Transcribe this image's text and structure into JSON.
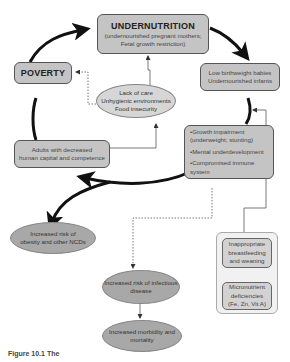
{
  "nodes": {
    "undernutrition": {
      "title": "UNDERNUTRITION",
      "lines": [
        "(undernourished pregnant mothers;",
        "Fetal growth restriction)"
      ]
    },
    "poverty": {
      "title": "POVERTY"
    },
    "low_birthweight": {
      "lines": [
        "Low birthweight babies",
        "Undernourished infants"
      ]
    },
    "causes": {
      "lines": [
        "Lack of care",
        "Unhygienic environments",
        "Food insecurity"
      ]
    },
    "growth_impairment": {
      "bullets": [
        "•Growth impairment",
        "(underweight; stunting)",
        "•Mental underdevelopment",
        "•Compromised immune system"
      ]
    },
    "adults": {
      "lines": [
        "Adults with decreased",
        "human capital and competence"
      ]
    },
    "obesity_risk": {
      "lines": [
        "Increased risk of",
        "obesity and other NCDs"
      ]
    },
    "infectious_risk": {
      "lines": [
        "Increased risk of infectious",
        "disease"
      ]
    },
    "morbidity": {
      "lines": [
        "Increased morbidity and",
        "mortality"
      ]
    },
    "breastfeeding": {
      "lines": [
        "Inappropriate",
        "breastfeeding",
        "and weaning"
      ]
    },
    "micronutrient": {
      "lines": [
        "Micronutrient",
        "deficiencies",
        "(Fe, Zn, Vit A)"
      ]
    }
  },
  "caption": {
    "text": "Figure 10.1  The"
  },
  "colors": {
    "box_fill": "#c4c4c4",
    "ellipse_dark": "#a8a8a8",
    "ellipse_light": "#d6d6d6",
    "arrow": "#111111"
  }
}
